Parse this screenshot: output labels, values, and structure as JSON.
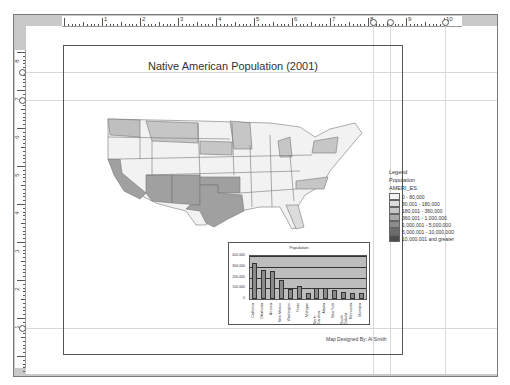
{
  "window": {
    "type": "map layout view"
  },
  "rulers": {
    "horizontal_labels": [
      "1",
      "2",
      "3",
      "4",
      "5",
      "6",
      "7",
      "8",
      "9",
      "10"
    ],
    "vertical_labels": [
      "8",
      "7",
      "6",
      "5",
      "4",
      "3",
      "2",
      "1"
    ]
  },
  "layout": {
    "title": "Native American Population (2001)",
    "credit": "Map Designed By: Al Smith"
  },
  "legend": {
    "title": "Legend",
    "layer": "Population",
    "field": "AMERI_ES",
    "classes": [
      {
        "label": "0 - 80,000",
        "color": "#f4f4f4"
      },
      {
        "label": "80,001 - 180,000",
        "color": "#dcdcdc"
      },
      {
        "label": "180,001 - 360,000",
        "color": "#c6c6c6"
      },
      {
        "label": "360,001 - 1,000,000",
        "color": "#a8a8a8"
      },
      {
        "label": "1,000,001 - 5,000,000",
        "color": "#8c8c8c"
      },
      {
        "label": "5,000,001 - 10,000,000",
        "color": "#6c6c6c"
      },
      {
        "label": "10,000,001 and greater",
        "color": "#4c4c4c"
      }
    ]
  },
  "chart_data": {
    "type": "bar",
    "title": "Population",
    "categories": [
      "California",
      "Oklahoma",
      "Arizona",
      "New Mexico",
      "Washington",
      "Texas",
      "Michigan",
      "North Carolina",
      "Alaska",
      "New York",
      "South Dakota",
      "Minnesota",
      "Montana"
    ],
    "values": [
      333000,
      273000,
      256000,
      173000,
      93000,
      118000,
      58000,
      100000,
      98000,
      82000,
      62000,
      55000,
      56000
    ],
    "ylim": [
      0,
      400000
    ],
    "yticks": [
      "0",
      "100,000",
      "200,000",
      "300,000",
      "400,000"
    ],
    "xlabel": "",
    "ylabel": ""
  }
}
